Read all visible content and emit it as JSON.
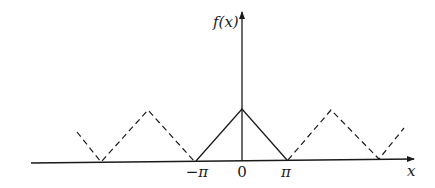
{
  "figure": {
    "y_axis_label": "f(x)",
    "x_axis_label": "x",
    "tick_labels": {
      "neg_pi": "−π",
      "zero": "0",
      "pos_pi": "π"
    },
    "segments": {
      "solid": "main period on [−π, π]",
      "dashed": "periodic extension"
    },
    "colors": {
      "line": "#1a1a1a",
      "background": "#ffffff"
    }
  }
}
